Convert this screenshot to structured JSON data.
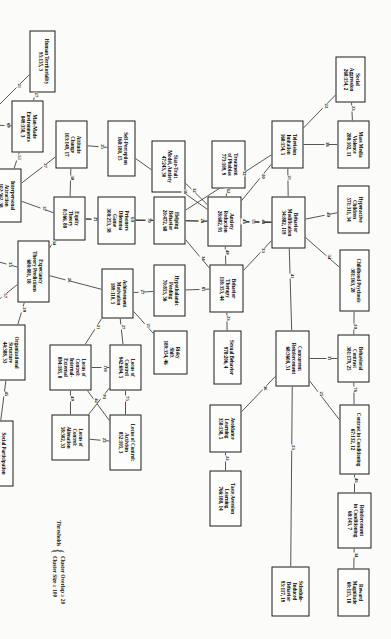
{
  "diagram": {
    "type": "network-graph",
    "title": "",
    "legend": {
      "label": "Thresholds",
      "rows": [
        "Cluster Overlap ≥ 20",
        "Cluster Size ≥ 100"
      ]
    },
    "nodes": [
      {
        "id": "social_aggression",
        "title": "Social\nAggression",
        "num": "268:154, 2",
        "x": 56,
        "y": 26,
        "w": 46,
        "h": 30
      },
      {
        "id": "mass_media_violence",
        "title": "Mass Media\nViolence",
        "num": "288:102, 11",
        "x": 120,
        "y": 22,
        "w": 48,
        "h": 32
      },
      {
        "id": "hyperactive_children",
        "title": "Hyperactive\nChildren",
        "num": "571:311, 34",
        "x": 185,
        "y": 22,
        "w": 48,
        "h": 32
      },
      {
        "id": "childhood_psychosis",
        "title": "Childhood Psychosis",
        "num": "381:163, 28",
        "x": 249,
        "y": 22,
        "w": 62,
        "h": 30
      },
      {
        "id": "behavioral_contrast",
        "title": "Behavioral\nContrast",
        "num": "381:179, 25",
        "x": 334,
        "y": 22,
        "w": 48,
        "h": 32
      },
      {
        "id": "contrast_conditioning",
        "title": "Contrast in Conditioning",
        "num": "67:132, 12",
        "x": 404,
        "y": 22,
        "w": 70,
        "h": 30
      },
      {
        "id": "reinforcement_cond",
        "title": "Reinforcement\nin Conditioning",
        "num": "68:143, 7",
        "x": 492,
        "y": 20,
        "w": 56,
        "h": 34
      },
      {
        "id": "reward_magnitude",
        "title": "Reward\nMagnitude",
        "num": "69:115, 18",
        "x": 568,
        "y": 22,
        "w": 48,
        "h": 32
      },
      {
        "id": "television_imitation",
        "title": "Television\nImitation",
        "num": "168:154, 5",
        "x": 120,
        "y": 88,
        "w": 48,
        "h": 32
      },
      {
        "id": "behavior_modification",
        "title": "Behavior\nModification",
        "num": "34:882, 119",
        "x": 196,
        "y": 86,
        "w": 52,
        "h": 34
      },
      {
        "id": "concurrent_reinforce",
        "title": "Concurrent\nReinforcement",
        "num": "68:3608, 51",
        "x": 330,
        "y": 82,
        "w": 56,
        "h": 34
      },
      {
        "id": "schedule_induced",
        "title": "Schedule-\nInduced\nBehavior",
        "num": "93:117, 19",
        "x": 566,
        "y": 82,
        "w": 50,
        "h": 38
      },
      {
        "id": "treatment_phobias",
        "title": "Treatment\nof Phobias",
        "num": "773:109, 9",
        "x": 140,
        "y": 146,
        "w": 48,
        "h": 34
      },
      {
        "id": "anxiety_reduction",
        "title": "Anxiety\nReduction",
        "num": "28:682, 95",
        "x": 196,
        "y": 150,
        "w": 50,
        "h": 34
      },
      {
        "id": "behavior_therapy",
        "title": "Behavior\nTherapy",
        "num": "118:353, 44",
        "x": 264,
        "y": 148,
        "w": 48,
        "h": 34
      },
      {
        "id": "sexual_behavior",
        "title": "Sexual Behavior",
        "num": "978:206, 4",
        "x": 330,
        "y": 150,
        "w": 54,
        "h": 28
      },
      {
        "id": "avoidance_learning",
        "title": "Avoidance\nLearning",
        "num": "358:138, 5",
        "x": 404,
        "y": 150,
        "w": 48,
        "h": 32
      },
      {
        "id": "taste_aversion",
        "title": "Taste Aversion\nLearning",
        "num": "766:188, 14",
        "x": 470,
        "y": 150,
        "w": 56,
        "h": 32
      },
      {
        "id": "state_trait_anxiety",
        "title": "State-Trait\nModel, Anxiety",
        "num": "47:243, 30",
        "x": 140,
        "y": 206,
        "w": 52,
        "h": 34
      },
      {
        "id": "self_perception",
        "title": "Self-Perception",
        "num": "168:180, 15",
        "x": 120,
        "y": 256,
        "w": 56,
        "h": 28
      },
      {
        "id": "helping_behavior",
        "title": "Helping\nBehavior",
        "num": "20:472, 68",
        "x": 196,
        "y": 206,
        "w": 48,
        "h": 32
      },
      {
        "id": "hypothalamic_feeding",
        "title": "Hypothalamic\nFeeding",
        "num": "70:853, 36",
        "x": 264,
        "y": 206,
        "w": 52,
        "h": 32
      },
      {
        "id": "risky_shift",
        "title": "Risky\nShift",
        "num": "189:354, 46",
        "x": 330,
        "y": 204,
        "w": 44,
        "h": 34
      },
      {
        "id": "attitude_change",
        "title": "Attitude\nChange",
        "num": "103:149, 17",
        "x": 120,
        "y": 304,
        "w": 48,
        "h": 32
      },
      {
        "id": "prisoners_dilemma",
        "title": "Prisoners\nDilemma\nGame",
        "num": "308:253, 38",
        "x": 196,
        "y": 256,
        "w": 48,
        "h": 38
      },
      {
        "id": "equity_theory",
        "title": "Equity\nTheory",
        "num": "8:566, 88",
        "x": 196,
        "y": 306,
        "w": 44,
        "h": 32
      },
      {
        "id": "achievement_motivation",
        "title": "Achievement\nMotivation",
        "num": "189:110, 5",
        "x": 268,
        "y": 258,
        "w": 50,
        "h": 32
      },
      {
        "id": "locus_control",
        "title": "Locus of\nControl",
        "num": "942:694, 5",
        "x": 344,
        "y": 250,
        "w": 46,
        "h": 32
      },
      {
        "id": "locus_control_activism",
        "title": "Locus of Control:\nActivism",
        "num": "852:105, 3",
        "x": 414,
        "y": 250,
        "w": 56,
        "h": 32
      },
      {
        "id": "locus_control_int_ext",
        "title": "Locus of\nControl:\nInternal-\nExternal",
        "num": "894:185, 8",
        "x": 344,
        "y": 300,
        "w": 46,
        "h": 42
      },
      {
        "id": "locus_control_alien",
        "title": "Locus of\nControl:\nAlienation",
        "num": "58:302, 33",
        "x": 414,
        "y": 302,
        "w": 46,
        "h": 38
      },
      {
        "id": "human_territoriality",
        "title": "Human Territoriality",
        "num": "95:135, 3",
        "x": 30,
        "y": 336,
        "w": 62,
        "h": 26
      },
      {
        "id": "man_made_env",
        "title": "Man-Made\nEnvironments",
        "num": "849:358, 3",
        "x": 100,
        "y": 348,
        "w": 52,
        "h": 32
      },
      {
        "id": "personal_space",
        "title": "Personal\nSpace",
        "num": "28:505, 48",
        "x": 100,
        "y": 396,
        "w": 48,
        "h": 32
      },
      {
        "id": "interpersonal_attr",
        "title": "Interpersonal\nAttraction",
        "num": "102:562, 38",
        "x": 168,
        "y": 370,
        "w": 54,
        "h": 32
      },
      {
        "id": "expectancy_theory",
        "title": "Expectancy\nTheory Predictions",
        "num": "680:881, 18",
        "x": 240,
        "y": 342,
        "w": 62,
        "h": 32
      },
      {
        "id": "motivation_job_sat",
        "title": "Motivation and\nJob Satisfaction",
        "num": "883:184, 3",
        "x": 226,
        "y": 400,
        "w": 58,
        "h": 32
      },
      {
        "id": "organizational_struct",
        "title": "Organizational\nStructure",
        "num": "44:388, 33",
        "x": 324,
        "y": 366,
        "w": 56,
        "h": 32
      },
      {
        "id": "org_theory_mgmt",
        "title": "Organizational\nTheory\nManagement",
        "num": "1089:593, 3",
        "x": 306,
        "y": 416,
        "w": 56,
        "h": 40
      },
      {
        "id": "leadership_style",
        "title": "Leadership\nStyle",
        "num": "780:111, 4",
        "x": 256,
        "y": 474,
        "w": 50,
        "h": 32
      },
      {
        "id": "org_decision_making",
        "title": "Organizational Decision Making",
        "num": "578:558, 3",
        "x": 374,
        "y": 432,
        "w": 82,
        "h": 30
      },
      {
        "id": "social_participation",
        "title": "Social Participation\nin Organizations",
        "num": "51:188, 29",
        "x": 420,
        "y": 378,
        "w": 66,
        "h": 34
      },
      {
        "id": "cognitive_balance",
        "title": "Cognitive\nBalance",
        "num": "4:181, 18",
        "x": 100,
        "y": 470,
        "w": 48,
        "h": 32
      },
      {
        "id": "impression_formation",
        "title": "Impression\nFormation",
        "num": "77:288, 29",
        "x": 170,
        "y": 470,
        "w": 50,
        "h": 34
      },
      {
        "id": "multiple_cue_learning",
        "title": "Multiple\nCue Learning",
        "num": "368:102, 29",
        "x": 242,
        "y": 470,
        "w": 50,
        "h": 32
      },
      {
        "id": "attitude_behavior",
        "title": "Attitude\nand Behavior",
        "num": "55:164, 18",
        "x": 170,
        "y": 528,
        "w": 52,
        "h": 32
      },
      {
        "id": "measurement_judgment",
        "title": "Measurement\nof Human\nJudgment",
        "num": "79:127, 4",
        "x": 242,
        "y": 526,
        "w": 52,
        "h": 38
      }
    ],
    "edges": [
      {
        "from": "social_aggression",
        "to": "mass_media_violence",
        "weight": "23"
      },
      {
        "from": "social_aggression",
        "to": "television_imitation",
        "weight": "22"
      },
      {
        "from": "mass_media_violence",
        "to": "television_imitation",
        "weight": "38"
      },
      {
        "from": "television_imitation",
        "to": "behavior_modification",
        "weight": "21"
      },
      {
        "from": "television_imitation",
        "to": "anxiety_reduction",
        "weight": "20"
      },
      {
        "from": "television_imitation",
        "to": "helping_behavior",
        "weight": "32"
      },
      {
        "from": "hyperactive_children",
        "to": "behavior_modification",
        "weight": "40"
      },
      {
        "from": "childhood_psychosis",
        "to": "behavior_modification",
        "weight": "34"
      },
      {
        "from": "behavior_modification",
        "to": "behavior_therapy",
        "weight": "33"
      },
      {
        "from": "behavior_modification",
        "to": "anxiety_reduction",
        "weight": "48"
      },
      {
        "from": "behavior_modification",
        "to": "helping_behavior",
        "weight": "46"
      },
      {
        "from": "behavior_modification",
        "to": "concurrent_reinforce",
        "weight": "41"
      },
      {
        "from": "behavioral_contrast",
        "to": "concurrent_reinforce",
        "weight": "31"
      },
      {
        "from": "behavioral_contrast",
        "to": "contrast_conditioning",
        "weight": "76"
      },
      {
        "from": "behavioral_contrast",
        "to": "childhood_psychosis",
        "weight": "20"
      },
      {
        "from": "contrast_conditioning",
        "to": "reinforcement_cond",
        "weight": "46"
      },
      {
        "from": "reinforcement_cond",
        "to": "reward_magnitude",
        "weight": "34"
      },
      {
        "from": "concurrent_reinforce",
        "to": "contrast_conditioning",
        "weight": "25"
      },
      {
        "from": "concurrent_reinforce",
        "to": "schedule_induced",
        "weight": "23"
      },
      {
        "from": "concurrent_reinforce",
        "to": "avoidance_learning",
        "weight": "36"
      },
      {
        "from": "avoidance_learning",
        "to": "taste_aversion",
        "weight": "22"
      },
      {
        "from": "treatment_phobias",
        "to": "anxiety_reduction",
        "weight": "62"
      },
      {
        "from": "state_trait_anxiety",
        "to": "anxiety_reduction",
        "weight": "32"
      },
      {
        "from": "anxiety_reduction",
        "to": "behavior_therapy",
        "weight": "49"
      },
      {
        "from": "anxiety_reduction",
        "to": "helping_behavior",
        "weight": "28"
      },
      {
        "from": "anxiety_reduction",
        "to": "self_perception",
        "weight": "36"
      },
      {
        "from": "anxiety_reduction",
        "to": "behavior_modification",
        "weight": "51"
      },
      {
        "from": "behavior_therapy",
        "to": "sexual_behavior",
        "weight": "23"
      },
      {
        "from": "behavior_therapy",
        "to": "hypothalamic_feeding",
        "weight": "81"
      },
      {
        "from": "behavior_therapy",
        "to": "helping_behavior",
        "weight": "34"
      },
      {
        "from": "helping_behavior",
        "to": "prisoners_dilemma",
        "weight": "70"
      },
      {
        "from": "helping_behavior",
        "to": "equity_theory",
        "weight": "60"
      },
      {
        "from": "self_perception",
        "to": "attitude_change",
        "weight": "25"
      },
      {
        "from": "attitude_change",
        "to": "equity_theory",
        "weight": "30"
      },
      {
        "from": "attitude_change",
        "to": "interpersonal_attr",
        "weight": "27"
      },
      {
        "from": "prisoners_dilemma",
        "to": "equity_theory",
        "weight": "21"
      },
      {
        "from": "equity_theory",
        "to": "expectancy_theory",
        "weight": "34"
      },
      {
        "from": "equity_theory",
        "to": "interpersonal_attr",
        "weight": "37"
      },
      {
        "from": "expectancy_theory",
        "to": "achievement_motivation",
        "weight": "26"
      },
      {
        "from": "expectancy_theory",
        "to": "organizational_struct",
        "weight": "29"
      },
      {
        "from": "expectancy_theory",
        "to": "motivation_job_sat",
        "weight": "33"
      },
      {
        "from": "expectancy_theory",
        "to": "org_theory_mgmt",
        "weight": "57"
      },
      {
        "from": "achievement_motivation",
        "to": "hypothalamic_feeding",
        "weight": "27"
      },
      {
        "from": "achievement_motivation",
        "to": "locus_control",
        "weight": "27"
      },
      {
        "from": "achievement_motivation",
        "to": "locus_control_int_ext",
        "weight": "21"
      },
      {
        "from": "locus_control",
        "to": "locus_control_activism",
        "weight": "75"
      },
      {
        "from": "locus_control",
        "to": "locus_control_int_ext",
        "weight": "110"
      },
      {
        "from": "locus_control",
        "to": "locus_control_alien",
        "weight": "93"
      },
      {
        "from": "locus_control_activism",
        "to": "locus_control_alien",
        "weight": "22"
      },
      {
        "from": "locus_control_int_ext",
        "to": "locus_control_alien",
        "weight": "49"
      },
      {
        "from": "locus_control_int_ext",
        "to": "locus_control_activism",
        "weight": "42"
      },
      {
        "from": "risky_shift",
        "to": "achievement_motivation",
        "weight": "21"
      },
      {
        "from": "human_territoriality",
        "to": "man_made_env",
        "weight": "27"
      },
      {
        "from": "human_territoriality",
        "to": "personal_space",
        "weight": "21"
      },
      {
        "from": "man_made_env",
        "to": "personal_space",
        "weight": "89"
      },
      {
        "from": "man_made_env",
        "to": "interpersonal_attr",
        "weight": "51"
      },
      {
        "from": "personal_space",
        "to": "interpersonal_attr",
        "weight": "30"
      },
      {
        "from": "interpersonal_attr",
        "to": "impression_formation",
        "weight": "33"
      },
      {
        "from": "motivation_job_sat",
        "to": "org_theory_mgmt",
        "weight": "38"
      },
      {
        "from": "org_theory_mgmt",
        "to": "organizational_struct",
        "weight": "59"
      },
      {
        "from": "org_theory_mgmt",
        "to": "leadership_style",
        "weight": "31"
      },
      {
        "from": "org_theory_mgmt",
        "to": "org_decision_making",
        "weight": "50"
      },
      {
        "from": "organizational_struct",
        "to": "org_decision_making",
        "weight": "33"
      },
      {
        "from": "organizational_struct",
        "to": "social_participation",
        "weight": "45"
      },
      {
        "from": "org_decision_making",
        "to": "social_participation",
        "weight": "21"
      },
      {
        "from": "cognitive_balance",
        "to": "impression_formation",
        "weight": "33"
      },
      {
        "from": "impression_formation",
        "to": "multiple_cue_learning",
        "weight": "21"
      },
      {
        "from": "impression_formation",
        "to": "attitude_behavior",
        "weight": "42"
      },
      {
        "from": "impression_formation",
        "to": "measurement_judgment",
        "weight": "28"
      }
    ]
  }
}
